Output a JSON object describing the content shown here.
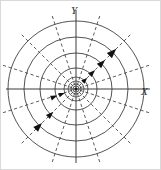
{
  "figure": {
    "title": "",
    "background_color": "#ffffff",
    "frame_color": "#d9d9d9",
    "width": 161,
    "height": 170
  },
  "axes": {
    "x_label": "X",
    "y_label": "Y",
    "origin": {
      "x": 76,
      "y": 89
    },
    "x_axis_from": {
      "x": 6,
      "y": 89
    },
    "x_axis_to": {
      "x": 150,
      "y": 89
    },
    "y_axis_from": {
      "x": 76,
      "y": 10
    },
    "y_axis_to": {
      "x": 76,
      "y": 163
    },
    "axis_color": "#3a3a3a",
    "x_label_pos": {
      "x": 141,
      "y": 95
    },
    "y_label_pos": {
      "x": 71,
      "y": 14
    }
  },
  "chart_data": {
    "type": "scatter",
    "xlabel": "X",
    "ylabel": "Y",
    "coordinate_system": "polar",
    "grid": false,
    "legend": "none",
    "center": {
      "x": 76,
      "y": 89
    },
    "circles": {
      "description": "Solid concentric circles centered at the origin representing closed orbits / limit cycles",
      "color": "#3f3f3f",
      "radii": [
        68,
        52,
        36,
        21,
        12,
        8,
        5,
        3
      ]
    },
    "rays": {
      "description": "Dashed radial lines (spiral trajectory guides) emanating from the origin",
      "color": "#4a4a4a",
      "dash_pattern": "3.2 2.6",
      "angles_deg": [
        18,
        45,
        72,
        108,
        135,
        162,
        198,
        225,
        252,
        288,
        315,
        342
      ],
      "inner_radius": 4,
      "outer_radius": 78
    },
    "arrows": {
      "description": "Arrowheads showing outward flow direction along the 45-degree ray and inward along the 225-degree ray",
      "color": "#111111",
      "markers": [
        {
          "angle_deg": 45,
          "radius": 16,
          "direction": "outward"
        },
        {
          "angle_deg": 45,
          "radius": 27,
          "direction": "outward"
        },
        {
          "angle_deg": 45,
          "radius": 41,
          "direction": "outward"
        },
        {
          "angle_deg": 45,
          "radius": 57,
          "direction": "outward"
        },
        {
          "angle_deg": 200,
          "radius": 12,
          "direction": "inward"
        },
        {
          "angle_deg": 200,
          "radius": 20,
          "direction": "inward"
        },
        {
          "angle_deg": 225,
          "radius": 32,
          "direction": "inward"
        },
        {
          "angle_deg": 225,
          "radius": 48,
          "direction": "inward"
        }
      ]
    },
    "core_marker": {
      "description": "Dark point mass at the origin where circles converge",
      "radius": 1.6,
      "color": "#151515"
    }
  }
}
